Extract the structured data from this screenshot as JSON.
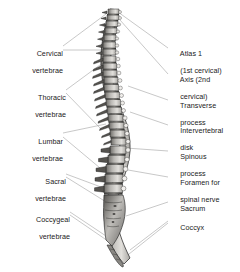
{
  "figure": {
    "background_color": "#ffffff",
    "text_color": "#1a1a1a",
    "leader_line_color": "#9a9a9a",
    "bone_fill_light": "#d8d6d2",
    "bone_fill_mid": "#8e8c88",
    "bone_outline": "#1c1c1c"
  },
  "labels_left": [
    {
      "id": "cervical-vertebrae",
      "line1": "Cervical",
      "line2": "vertebrae",
      "x": 10,
      "y": 42
    },
    {
      "id": "thoracic-vertebrae",
      "line1": "Thoracic",
      "line2": "vertebrae",
      "x": 10,
      "y": 86
    },
    {
      "id": "lumbar-vertebrae",
      "line1": "Lumbar",
      "line2": "vertebrae",
      "x": 10,
      "y": 130
    },
    {
      "id": "sacral-vertebrae",
      "line1": "Sacral",
      "line2": "vertebrae",
      "x": 10,
      "y": 170
    },
    {
      "id": "coccygeal-vertebrae",
      "line1": "Coccygeal",
      "line2": "vertebrae",
      "x": 10,
      "y": 208
    }
  ],
  "labels_right": [
    {
      "id": "atlas",
      "line1": "Atlas 1",
      "line2": "(1st cervical)",
      "x": 172,
      "y": 45
    },
    {
      "id": "axis",
      "line1": "Axis (2nd",
      "line2": "cervical)",
      "x": 172,
      "y": 71
    },
    {
      "id": "transverse-process",
      "line1": "Transverse",
      "line2": "process",
      "x": 172,
      "y": 97
    },
    {
      "id": "intervertebral-disk",
      "line1": "Intervertebral",
      "line2": "disk",
      "x": 172,
      "y": 122
    },
    {
      "id": "spinous-process",
      "line1": "Spinous",
      "line2": "process",
      "x": 172,
      "y": 148
    },
    {
      "id": "foramen-spinal-nerve",
      "line1": "Foramen for",
      "line2": "spinal nerve",
      "x": 172,
      "y": 174
    },
    {
      "id": "sacrum",
      "line1": "Sacrum",
      "line2": "",
      "x": 172,
      "y": 200
    },
    {
      "id": "coccyx",
      "line1": "Coccyx",
      "line2": "",
      "x": 172,
      "y": 219
    }
  ]
}
